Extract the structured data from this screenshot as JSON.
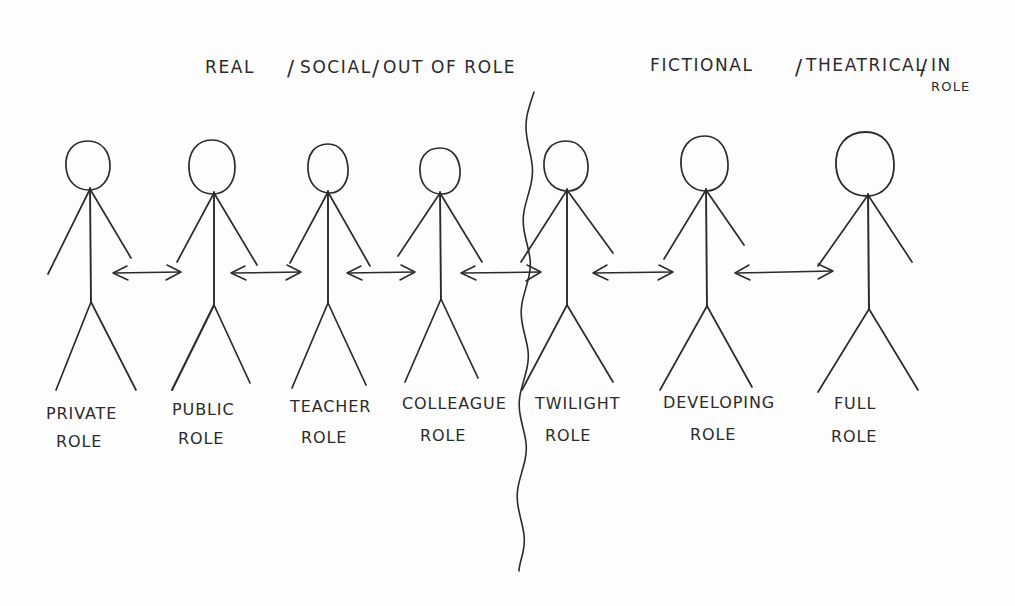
{
  "diagram": {
    "title_left": "REAL | SOCIAL | OUT OF ROLE",
    "title_right": "FICTIONAL | THEATRICAL | IN ROLE",
    "ink_color": "#2b2b2b",
    "paper_color": "#fdfdfd",
    "header_left": {
      "part1": "REAL",
      "sep1": "/",
      "part2": "SOCIAL",
      "sep2": "/",
      "part3": "OUT OF ROLE"
    },
    "header_right": {
      "part1": "FICTIONAL",
      "sep1": "/",
      "part2": "THEATRICAL",
      "sep2": "/",
      "part3": "IN",
      "part3_line2": "ROLE"
    },
    "figures": [
      {
        "line1": "PRIVATE",
        "line2": "ROLE",
        "side": "real"
      },
      {
        "line1": "PUBLIC",
        "line2": "ROLE",
        "side": "real"
      },
      {
        "line1": "TEACHER",
        "line2": "ROLE",
        "side": "real"
      },
      {
        "line1": "COLLEAGUE",
        "line2": "ROLE",
        "side": "real"
      },
      {
        "line1": "TWILIGHT",
        "line2": "ROLE",
        "side": "boundary"
      },
      {
        "line1": "DEVELOPING",
        "line2": "ROLE",
        "side": "fictional"
      },
      {
        "line1": "FULL",
        "line2": "ROLE",
        "side": "fictional"
      }
    ],
    "connectors": {
      "count": 6,
      "style": "double-headed-arrow"
    },
    "divider": {
      "style": "wavy-vertical-line",
      "label": "real-fictional-boundary"
    }
  }
}
